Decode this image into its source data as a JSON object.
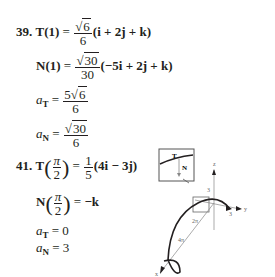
{
  "problem39": {
    "number": "39.",
    "T": {
      "lhs": "T(1)",
      "eq": "=",
      "coef_num": "6",
      "coef_den": "6",
      "vec": "(i + 2j + k)"
    },
    "N": {
      "lhs": "N(1)",
      "eq": "=",
      "coef_num": "30",
      "coef_den": "30",
      "vec": "(−5i + 2j + k)"
    },
    "aT": {
      "sym": "a",
      "sub": "T",
      "eq": "=",
      "num_coef": "5",
      "num_rad": "6",
      "den": "6"
    },
    "aN": {
      "sym": "a",
      "sub": "N",
      "eq": "=",
      "num_rad": "30",
      "den": "6"
    }
  },
  "problem41": {
    "number": "41.",
    "T": {
      "lhs": "T",
      "arg_num": "π",
      "arg_den": "2",
      "eq": "=",
      "coef_num": "1",
      "coef_den": "5",
      "vec": "(4i − 3j)"
    },
    "N": {
      "lhs": "N",
      "arg_num": "π",
      "arg_den": "2",
      "eq": "=",
      "rhs": "−k"
    },
    "aT": {
      "sym": "a",
      "sub": "T",
      "eq": "=",
      "value": "0"
    },
    "aN": {
      "sym": "a",
      "sub": "N",
      "eq": "=",
      "value": "3"
    }
  },
  "figure": {
    "inset_T": "T",
    "inset_N": "N",
    "axis_z": "z",
    "axis_y": "y",
    "axis_x": "x",
    "tick_z": "3",
    "tick_y": "3",
    "label_2pi": "2π",
    "label_4pi": "4π"
  }
}
